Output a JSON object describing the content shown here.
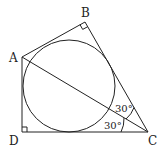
{
  "diagram": {
    "type": "geometry",
    "points": {
      "A": {
        "label": "A",
        "x": 22,
        "y": 57
      },
      "B": {
        "label": "B",
        "x": 85,
        "y": 22
      },
      "C": {
        "label": "C",
        "x": 148,
        "y": 132
      },
      "D": {
        "label": "D",
        "x": 22,
        "y": 132
      }
    },
    "circle": {
      "cx": 69,
      "cy": 85,
      "r": 47
    },
    "right_angles": [
      "B",
      "D"
    ],
    "angles": [
      {
        "at": "C",
        "between": "BC-AC",
        "label": "30°"
      },
      {
        "at": "C",
        "between": "AC-DC",
        "label": "30°"
      }
    ],
    "segments": [
      "AB",
      "BC",
      "CD",
      "DA",
      "AC"
    ]
  }
}
